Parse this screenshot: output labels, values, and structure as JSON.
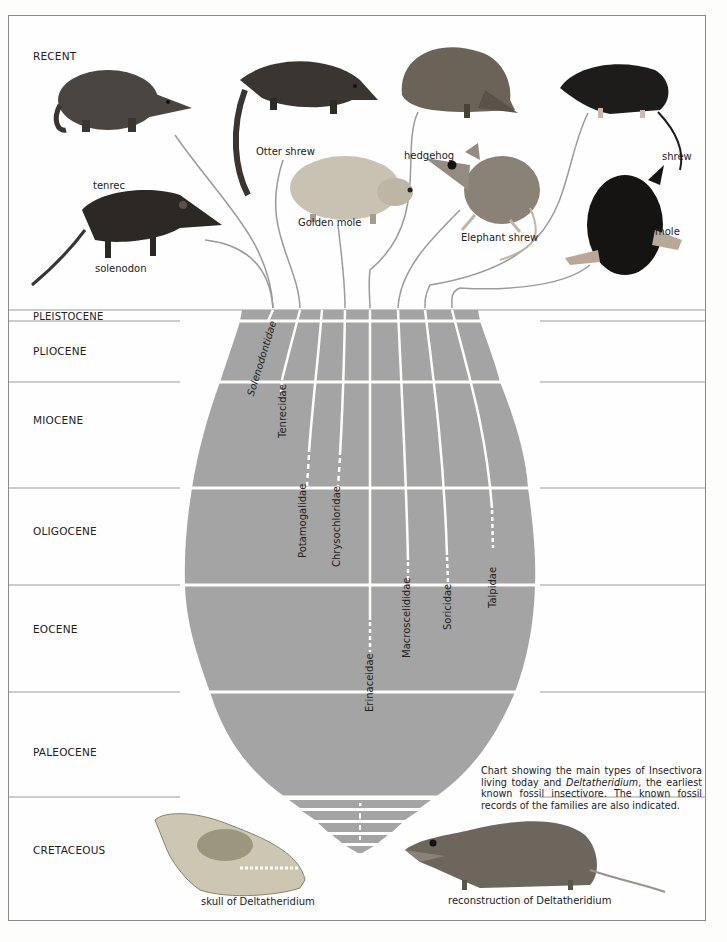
{
  "epochs": [
    {
      "name": "RECENT",
      "label_y": 78
    },
    {
      "name": "PLEISTOCENE",
      "label_y": 318
    },
    {
      "name": "PLIOCENE",
      "label_y": 352
    },
    {
      "name": "MIOCENE",
      "label_y": 421
    },
    {
      "name": "OLIGOCENE",
      "label_y": 532
    },
    {
      "name": "EOCENE",
      "label_y": 630
    },
    {
      "name": "PALEOCENE",
      "label_y": 753
    },
    {
      "name": "CRETACEOUS",
      "label_y": 851
    }
  ],
  "animals": [
    {
      "name": "tenrec"
    },
    {
      "name": "Otter shrew"
    },
    {
      "name": "hedgehog"
    },
    {
      "name": "shrew"
    },
    {
      "name": "Golden mole"
    },
    {
      "name": "Elephant shrew"
    },
    {
      "name": "mole"
    },
    {
      "name": "solenodon"
    }
  ],
  "families": [
    {
      "name": "Solenodontidae",
      "italic": true
    },
    {
      "name": "Tenrecidae"
    },
    {
      "name": "Potamogalidae"
    },
    {
      "name": "Chrysochloridae"
    },
    {
      "name": "Erinaceidae"
    },
    {
      "name": "Macroscelididae"
    },
    {
      "name": "Soricidae"
    },
    {
      "name": "Talpidae"
    }
  ],
  "caption": {
    "part1": "Chart showing the main types of Insectivora living today and ",
    "italic": "Deltatheridium",
    "part2": ", the earliest known fossil insectivore. The known fossil records of the families are also indicated."
  },
  "figures": {
    "skull_label": "skull of Deltatheridium",
    "reconstruction_label": "reconstruction of Deltatheridium"
  },
  "colors": {
    "trunk": "#a4a4a4",
    "frame": "#8a8a8a",
    "lines": "#ffffff",
    "curves": "#9a9a9a"
  }
}
